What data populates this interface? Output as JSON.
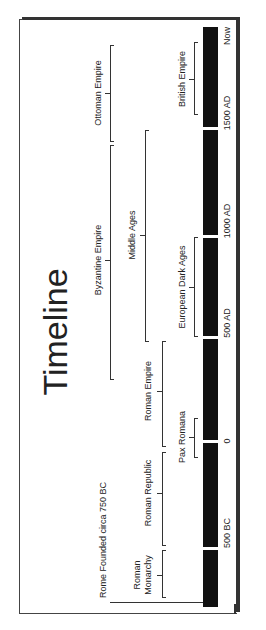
{
  "title": "Timeline",
  "colors": {
    "bar": "#111111",
    "frame": "#333333",
    "text": "#222222",
    "background": "#ffffff"
  },
  "axis": {
    "ticks": [
      {
        "label": "Now",
        "y": 27
      },
      {
        "label": "1500 AD",
        "y": 128
      },
      {
        "label": "1000 AD",
        "y": 236
      },
      {
        "label": "500 AD",
        "y": 337
      },
      {
        "label": "0",
        "y": 441
      },
      {
        "label": "500 BC",
        "y": 548
      }
    ]
  },
  "periods": [
    {
      "label": "Ottoman Empire",
      "start": "1299 AD",
      "end": "1922 AD"
    },
    {
      "label": "British Empire",
      "start": "1583 AD",
      "end": "1997 AD"
    },
    {
      "label": "Byzantine Empire",
      "start": "330 AD",
      "end": "1453 AD"
    },
    {
      "label": "Middle Ages",
      "start": "476 AD",
      "end": "1500 AD"
    },
    {
      "label": "European Dark Ages",
      "start": "500 AD",
      "end": "1000 AD"
    },
    {
      "label": "Roman Empire",
      "start": "27 BC",
      "end": "476 AD"
    },
    {
      "label": "Pax Romana",
      "start": "27 BC",
      "end": "180 AD"
    },
    {
      "label": "Roman Republic",
      "start": "509 BC",
      "end": "27 BC"
    },
    {
      "label": "Roman Monarchy",
      "label_line1": "Roman",
      "label_line2": "Monarchy",
      "start": "753 BC",
      "end": "509 BC"
    }
  ],
  "events": [
    {
      "label": "Rome Founded circa 750 BC"
    }
  ]
}
